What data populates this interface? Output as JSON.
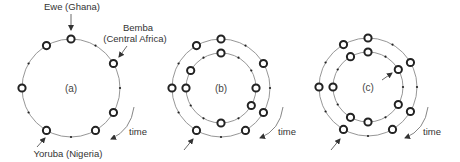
{
  "figure": {
    "panels": [
      {
        "id": "a",
        "label": "(a)",
        "center": [
          71,
          88
        ],
        "rings": [
          {
            "radius": 49,
            "onset_positions": [
              0,
              2,
              4,
              5,
              7,
              9,
              11
            ],
            "start_offset": 0
          }
        ],
        "annotations": [
          {
            "text": "Ewe (Ghana)",
            "points_to_position": 0,
            "ring": 0
          },
          {
            "text_lines": [
              "Bemba",
              "(Central Africa)"
            ],
            "points_to_position": 2,
            "ring": 0
          },
          {
            "text": "Yoruba (Nigeria)",
            "points_to_position": 7,
            "ring": 0
          }
        ],
        "time_label": "time"
      },
      {
        "id": "b",
        "label": "(b)",
        "center": [
          221,
          88
        ],
        "rings": [
          {
            "radius": 49,
            "onset_positions": [
              0,
              2,
              4,
              5,
              7,
              9,
              11
            ],
            "start_offset": 0
          },
          {
            "radius": 35,
            "onset_positions": [
              0,
              3,
              4,
              6,
              9,
              10
            ],
            "start_offset": 0
          }
        ],
        "time_label": "time"
      },
      {
        "id": "c",
        "label": "(c)",
        "center": [
          368,
          87
        ],
        "rings": [
          {
            "radius": 49,
            "onset_positions": [
              0,
              2,
              4,
              5,
              7,
              9,
              11
            ],
            "start_offset": 0
          },
          {
            "radius": 35,
            "onset_positions": [
              0,
              2,
              4,
              6,
              7,
              9,
              11
            ],
            "start_offset": 0
          }
        ],
        "time_label": "time"
      }
    ],
    "pulses_per_cycle": 12,
    "legend": {
      "onset": "hollow circle = struck pulse",
      "rest": "small dot = silent pulse"
    }
  },
  "labels": {
    "ewe": "Ewe (Ghana)",
    "bemba_1": "Bemba",
    "bemba_2": "(Central Africa)",
    "yoruba": "Yoruba (Nigeria)",
    "panel_a": "(a)",
    "panel_b": "(b)",
    "panel_c": "(c)",
    "time": "time"
  }
}
